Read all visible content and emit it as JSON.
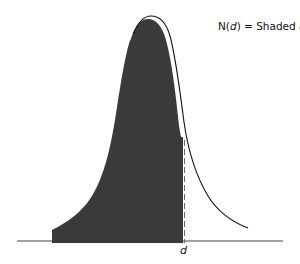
{
  "figure": {
    "annotation": {
      "prefix": "N(",
      "variable": "d",
      "suffix": ") = Shaded area"
    },
    "x_marker_label": "d",
    "colors": {
      "shaded_fill": "#3a3a3a",
      "curve_stroke": "#111111",
      "baseline": "#444444",
      "dashed_line": "#555555",
      "background": "#ffffff"
    }
  }
}
